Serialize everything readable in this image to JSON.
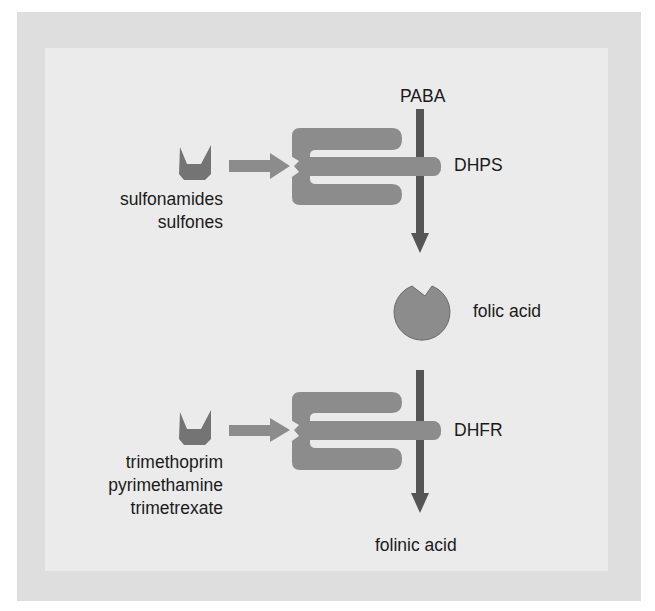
{
  "colors": {
    "outer_frame": "#dedede",
    "inner_panel": "#ebebeb",
    "enzyme": "#8c8c8c",
    "inhibitor": "#747474",
    "pathway_arrow": "#555555",
    "inhibitor_arrow": "#8c8c8c",
    "text": "#1a1a1a"
  },
  "pathway": {
    "substrate": "PABA",
    "intermediate": "folic acid",
    "product": "folinic acid"
  },
  "enzymes": [
    {
      "name": "DHPS",
      "inhibitors": [
        "sulfonamides",
        "sulfones"
      ],
      "icon": "enzyme-comb-shape"
    },
    {
      "name": "DHFR",
      "inhibitors": [
        "trimethoprim",
        "pyrimethamine",
        "trimetrexate"
      ],
      "icon": "enzyme-comb-shape"
    }
  ],
  "labels": {
    "paba": "PABA",
    "dhps": "DHPS",
    "folic_acid": "folic acid",
    "dhfr": "DHFR",
    "folinic_acid": "folinic acid",
    "inhibitors_1": [
      "sulfonamides",
      "sulfones"
    ],
    "inhibitors_2": [
      "trimethoprim",
      "pyrimethamine",
      "trimetrexate"
    ]
  }
}
